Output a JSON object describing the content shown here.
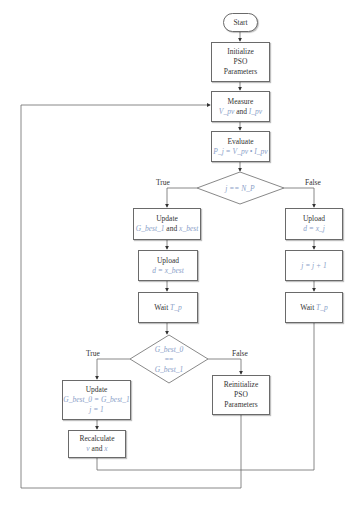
{
  "nodes": {
    "start": {
      "label": "Start"
    },
    "init": {
      "line1": "Initialize",
      "line2": "PSO",
      "line3": "Parameters"
    },
    "measure": {
      "line1": "Measure",
      "line2_math1": "V_pv",
      "line2_and": " and ",
      "line2_math2": "I_pv"
    },
    "evaluate": {
      "line1": "Evaluate",
      "line2_math": "P_j = V_pv • I_pv"
    },
    "decision1": {
      "math": "j == N_P",
      "true_label": "True",
      "false_label": "False"
    },
    "update1": {
      "line1": "Update",
      "line2_math1": "G_best_1",
      "line2_and": " and ",
      "line2_math2": "x_best"
    },
    "upload1": {
      "line1": "Upload",
      "line2_math": "d = x_best"
    },
    "wait1": {
      "text": "Wait ",
      "math": "T_p"
    },
    "decision2": {
      "math_top": "G_best_0",
      "eq": "==",
      "math_bottom": "G_best_1",
      "true_label": "True",
      "false_label": "False"
    },
    "update2": {
      "line1": "Update",
      "line2_math": "G_best_0 = G_best_1",
      "line3_math": "j = 1"
    },
    "recalc": {
      "line1": "Recalculate",
      "line2_math1": "v",
      "line2_and": " and ",
      "line2_math2": "x"
    },
    "reinit": {
      "line1": "Reinitialize",
      "line2": "PSO",
      "line3": "Parameters"
    },
    "upload2": {
      "line1": "Upload",
      "line2_math": "d = x_j"
    },
    "increment": {
      "math": "j = j + 1"
    },
    "wait2": {
      "text": "Wait ",
      "math": "T_p"
    }
  },
  "colors": {
    "line": "#6a6a6a",
    "math": "#8aa0c8"
  }
}
